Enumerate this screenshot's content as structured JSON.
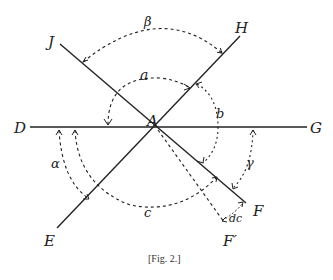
{
  "figure": {
    "caption": "[Fig. 2.]",
    "center_label": "A",
    "point_labels": {
      "D": "D",
      "G": "G",
      "J": "J",
      "H": "H",
      "E": "E",
      "F": "F",
      "F_prime": "F′"
    },
    "angle_labels": {
      "alpha_upper": "a",
      "b": "b",
      "c": "c",
      "beta": "β",
      "alpha_greek": "α",
      "gamma": "γ",
      "dc": "dc"
    },
    "colors": {
      "ink": "#222222",
      "background": "#ffffff"
    }
  }
}
